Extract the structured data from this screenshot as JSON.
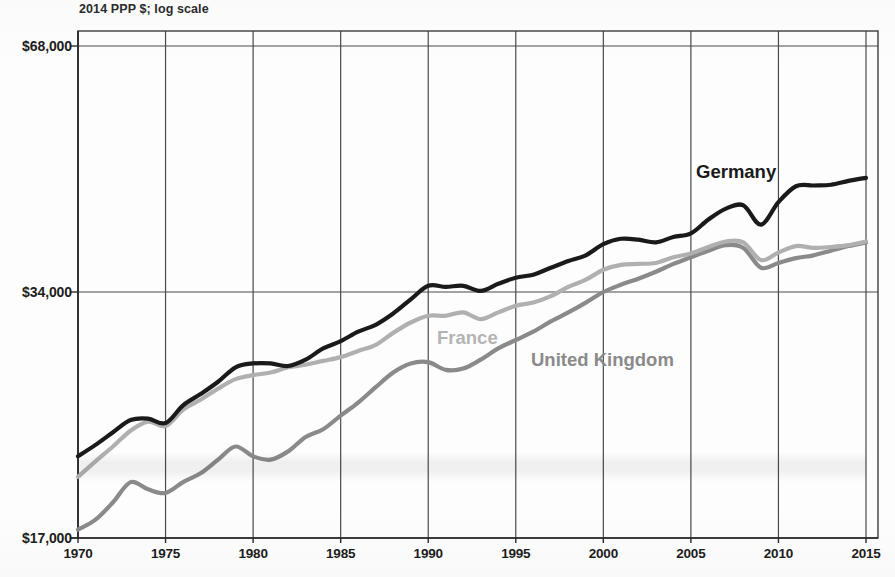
{
  "chart_data": {
    "type": "line",
    "title": "",
    "subtitle": "2014 PPP $; log scale",
    "xlabel": "",
    "ylabel": "",
    "scale": "log",
    "grid": true,
    "legend_position": "inline-labels",
    "xlim": [
      1970,
      2015
    ],
    "ylim": [
      17000,
      68000
    ],
    "xticks": [
      "1970",
      "1975",
      "1980",
      "1985",
      "1990",
      "1995",
      "2000",
      "2005",
      "2010",
      "2015"
    ],
    "yticks": [
      "$17,000",
      "$34,000",
      "$68,000"
    ],
    "ytick_values": [
      17000,
      34000,
      68000
    ],
    "x": [
      1970,
      1971,
      1972,
      1973,
      1974,
      1975,
      1976,
      1977,
      1978,
      1979,
      1980,
      1981,
      1982,
      1983,
      1984,
      1985,
      1986,
      1987,
      1988,
      1989,
      1990,
      1991,
      1992,
      1993,
      1994,
      1995,
      1996,
      1997,
      1998,
      1999,
      2000,
      2001,
      2002,
      2003,
      2004,
      2005,
      2006,
      2007,
      2008,
      2009,
      2010,
      2011,
      2012,
      2013,
      2014,
      2015
    ],
    "series": [
      {
        "name": "Germany",
        "color": "#1a1a1a",
        "label_color": "#1a1a1a",
        "values": [
          21400,
          22100,
          22900,
          23700,
          23800,
          23500,
          24700,
          25500,
          26400,
          27500,
          27800,
          27800,
          27600,
          28100,
          29000,
          29600,
          30400,
          31000,
          32000,
          33300,
          34600,
          34500,
          34600,
          34100,
          34800,
          35400,
          35700,
          36400,
          37100,
          37700,
          38900,
          39500,
          39400,
          39100,
          39700,
          40100,
          41700,
          43000,
          43400,
          41100,
          43800,
          45800,
          45900,
          46000,
          46500,
          46900
        ]
      },
      {
        "name": "France",
        "color": "#b0b0b0",
        "label_color": "#b4b4b4",
        "values": [
          20200,
          21100,
          22000,
          23000,
          23600,
          23300,
          24400,
          25100,
          25900,
          26600,
          26900,
          27100,
          27500,
          27700,
          28000,
          28300,
          28800,
          29300,
          30300,
          31200,
          31800,
          31800,
          32100,
          31500,
          32100,
          32700,
          33000,
          33600,
          34500,
          35200,
          36200,
          36700,
          36800,
          36900,
          37500,
          37900,
          38600,
          39200,
          39100,
          37200,
          38000,
          38700,
          38500,
          38600,
          38800,
          39200
        ]
      },
      {
        "name": "United Kingdom",
        "color": "#8a8a8a",
        "label_color": "#8a8a8a",
        "values": [
          17400,
          17900,
          18800,
          19900,
          19500,
          19300,
          19900,
          20400,
          21200,
          22000,
          21400,
          21200,
          21700,
          22600,
          23100,
          24000,
          24900,
          26000,
          27100,
          27800,
          27900,
          27300,
          27400,
          28100,
          29000,
          29700,
          30400,
          31300,
          32100,
          33000,
          34000,
          34700,
          35300,
          36000,
          36800,
          37500,
          38200,
          38800,
          38500,
          36400,
          36900,
          37400,
          37700,
          38200,
          38700,
          39100
        ]
      }
    ]
  },
  "labels": {
    "germany": "Germany",
    "france": "France",
    "united_kingdom": "United Kingdom"
  }
}
